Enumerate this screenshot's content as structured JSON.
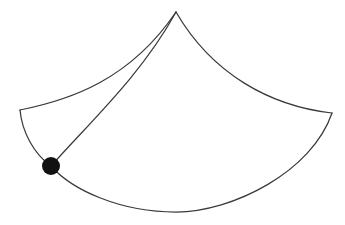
{
  "figure": {
    "type": "geometric-line-drawing",
    "canvas": {
      "width": 345,
      "height": 225,
      "background": "#ffffff"
    },
    "stroke": {
      "color": "#3a3a3a",
      "width": 1.25
    },
    "vertices": {
      "apex": {
        "label": "apex-cusp",
        "x": 176,
        "y": 12
      },
      "left_corner": {
        "label": "left-corner",
        "x": 20,
        "y": 110
      },
      "right_corner": {
        "label": "right-corner",
        "x": 332,
        "y": 113
      },
      "marked_point": {
        "label": "marked-vertex",
        "x": 51,
        "y": 166
      },
      "tangency": {
        "label": "tangency-point",
        "x": 142,
        "y": 74
      }
    },
    "marked_point_style": {
      "shape": "filled-circle",
      "radius": 9,
      "color": "#111111"
    },
    "edges": [
      {
        "name": "upper-left-arc",
        "from": "left-corner",
        "to": "apex-cusp",
        "curvature": "concave-up",
        "path": "M 20 110 C 70 100, 130 80, 176 12"
      },
      {
        "name": "upper-right-arc",
        "from": "apex-cusp",
        "to": "right-corner",
        "curvature": "convex-up",
        "path": "M 176 12 C 212 74, 270 106, 332 113"
      },
      {
        "name": "lower-right-arc",
        "from": "right-corner",
        "to": "marked-vertex",
        "curvature": "concave-up",
        "path": "M 332 113 C 312 172, 232 212, 176 212 C 120 212, 72 190, 51 166"
      },
      {
        "name": "left-short-arc",
        "from": "left-corner",
        "to": "marked-vertex",
        "curvature": "concave-right",
        "path": "M 20 110 C 22 132, 34 154, 51 166"
      },
      {
        "name": "chord-arc",
        "from": "marked-vertex",
        "to": "apex-cusp",
        "curvature": "near-straight",
        "path": "M 51 166 C 92 120, 142 74, 176 12"
      }
    ]
  }
}
